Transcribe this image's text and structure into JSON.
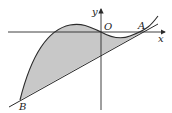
{
  "figure": {
    "colors": {
      "stroke": "#2b2b2b",
      "shade": "#c8c8c8",
      "background": "#ffffff"
    },
    "labels": {
      "x_axis": "x",
      "y_axis": "y",
      "origin": "O",
      "point_a": "A",
      "point_b": "B"
    }
  }
}
